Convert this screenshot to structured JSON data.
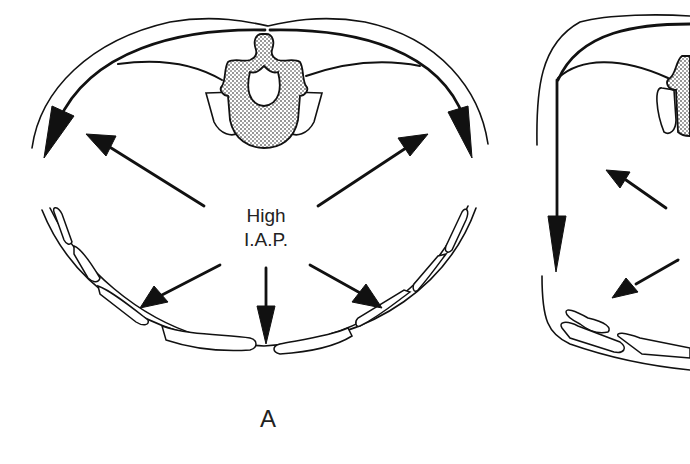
{
  "figure": {
    "panels": [
      {
        "id": "A",
        "label": "A",
        "center_text_line1": "High",
        "center_text_line2": "I.A.P.",
        "description": "Cross-section of abdomen with rounded wall; outward force arrows radiating from center; curved tension arrows along posterior wall descending laterally"
      },
      {
        "id": "B",
        "label": "",
        "description": "Partially visible second cross-section with flattened, squared wall; straight downward tension arrow on left; cropped at right edge"
      }
    ],
    "colors": {
      "line": "#111111",
      "background": "#ffffff",
      "text": "#222222"
    },
    "icons": {
      "arrow": "solid-arrowhead",
      "vertebra": "stippled-vertebra"
    }
  }
}
